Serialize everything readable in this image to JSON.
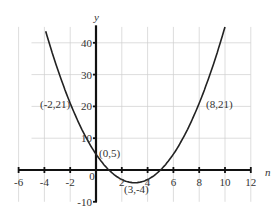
{
  "chart_data": {
    "type": "line",
    "title": "",
    "xlabel": "n",
    "ylabel": "y",
    "xlim": [
      -6,
      12
    ],
    "ylim": [
      -10,
      45
    ],
    "grid": true,
    "x_ticks": [
      -6,
      -4,
      -2,
      0,
      2,
      4,
      6,
      8,
      10,
      12
    ],
    "y_ticks": [
      -10,
      10,
      20,
      30,
      40
    ],
    "x_tick_labels": [
      "-6",
      "-4",
      "-2",
      "0",
      "2",
      "4",
      "6",
      "8",
      "10",
      "12"
    ],
    "y_tick_labels": [
      "-10",
      "10",
      "20",
      "30",
      "40"
    ],
    "series": [
      {
        "name": "y = n^2 - 6n + 5",
        "function": "n^2 - 6n + 5",
        "x": [
          -4,
          -3,
          -2,
          -1,
          0,
          1,
          2,
          3,
          4,
          5,
          6,
          7,
          8,
          9,
          10
        ],
        "values": [
          45,
          32,
          21,
          12,
          5,
          0,
          -3,
          -4,
          -3,
          0,
          5,
          12,
          21,
          32,
          45
        ]
      }
    ],
    "annotations": [
      {
        "text": "(-2,21)",
        "x": -2,
        "y": 21
      },
      {
        "text": "(0,5)",
        "x": 0,
        "y": 5
      },
      {
        "text": "(3,-4)",
        "x": 3,
        "y": -4
      },
      {
        "text": "(8,21)",
        "x": 8,
        "y": 21
      }
    ]
  },
  "labels": {
    "x_axis_name": "n",
    "y_axis_name": "y",
    "origin": "0"
  }
}
